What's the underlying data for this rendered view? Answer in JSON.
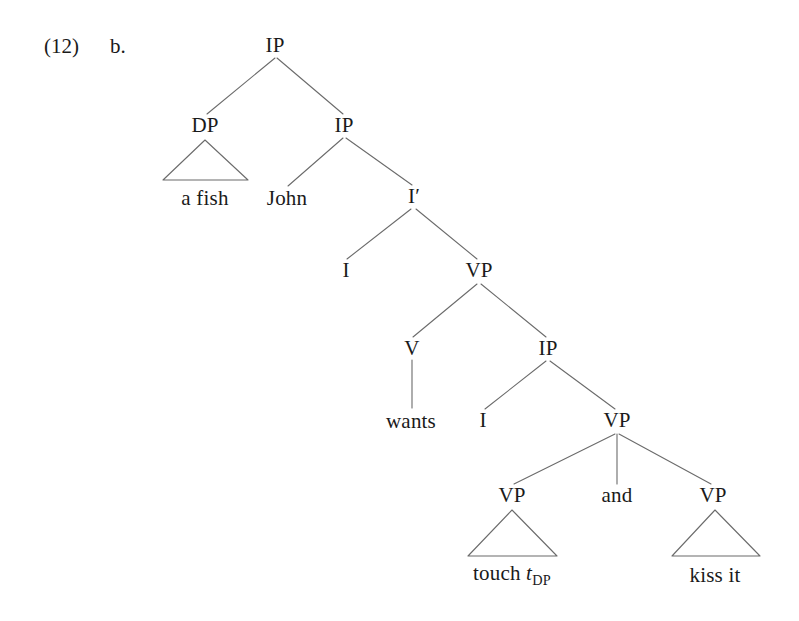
{
  "figure": {
    "example_number": "(12)",
    "sub_label": "b.",
    "caption_full": "(12) b."
  },
  "colors": {
    "background": "#ffffff",
    "text": "#1a1a1a",
    "edge": "#6b6b6b"
  },
  "tree": {
    "type": "syntax-tree",
    "sentence": "a fish John wants touch t-DP and kiss it",
    "nodes": {
      "root_ip": {
        "label": "IP",
        "x": 275,
        "y": 45
      },
      "dp": {
        "label": "DP",
        "x": 205,
        "y": 125
      },
      "ip2": {
        "label": "IP",
        "x": 344,
        "y": 125
      },
      "i_bar": {
        "label": "I′",
        "x": 414,
        "y": 196
      },
      "i1": {
        "label": "I",
        "x": 346,
        "y": 270
      },
      "vp1": {
        "label": "VP",
        "x": 479,
        "y": 270
      },
      "v": {
        "label": "V",
        "x": 412,
        "y": 348
      },
      "ip3": {
        "label": "IP",
        "x": 548,
        "y": 348
      },
      "i2": {
        "label": "I",
        "x": 483,
        "y": 420
      },
      "vp2": {
        "label": "VP",
        "x": 617,
        "y": 420
      },
      "vp_left": {
        "label": "VP",
        "x": 512,
        "y": 495
      },
      "conj": {
        "label": "and",
        "x": 617,
        "y": 495
      },
      "vp_right": {
        "label": "VP",
        "x": 713,
        "y": 495
      }
    },
    "terminals": {
      "a_fish": {
        "label": "a fish",
        "x": 205,
        "y": 198
      },
      "john": {
        "label": "John",
        "x": 287,
        "y": 198
      },
      "wants": {
        "label": "wants",
        "x": 411,
        "y": 421
      },
      "touch_trace": {
        "label_prefix": "touch ",
        "trace_symbol": "t",
        "trace_subscript": "DP",
        "x": 512,
        "y": 575
      },
      "kiss_it": {
        "label": "kiss it",
        "x": 715,
        "y": 575
      }
    },
    "triangles": [
      {
        "name": "dp-triangle",
        "apex_x": 205,
        "apex_y": 140,
        "left_x": 163,
        "right_x": 248,
        "base_y": 180
      },
      {
        "name": "vp-left-triangle",
        "apex_x": 512,
        "apex_y": 510,
        "left_x": 468,
        "right_x": 557,
        "base_y": 556
      },
      {
        "name": "vp-right-triangle",
        "apex_x": 715,
        "apex_y": 510,
        "left_x": 672,
        "right_x": 760,
        "base_y": 556
      }
    ],
    "edges": [
      {
        "name": "root-ip-to-dp",
        "x1": 275,
        "y1": 58,
        "x2": 207,
        "y2": 114
      },
      {
        "name": "root-ip-to-ip2",
        "x1": 277,
        "y1": 58,
        "x2": 343,
        "y2": 114
      },
      {
        "name": "ip2-to-john",
        "x1": 343,
        "y1": 138,
        "x2": 288,
        "y2": 186
      },
      {
        "name": "ip2-to-i-bar",
        "x1": 346,
        "y1": 138,
        "x2": 412,
        "y2": 185
      },
      {
        "name": "i-bar-to-i1",
        "x1": 411,
        "y1": 209,
        "x2": 347,
        "y2": 259
      },
      {
        "name": "i-bar-to-vp1",
        "x1": 416,
        "y1": 209,
        "x2": 477,
        "y2": 259
      },
      {
        "name": "vp1-to-v",
        "x1": 477,
        "y1": 284,
        "x2": 413,
        "y2": 337
      },
      {
        "name": "vp1-to-ip3",
        "x1": 481,
        "y1": 284,
        "x2": 546,
        "y2": 337
      },
      {
        "name": "v-to-wants",
        "x1": 412,
        "y1": 360,
        "x2": 412,
        "y2": 408
      },
      {
        "name": "ip3-to-i2",
        "x1": 546,
        "y1": 361,
        "x2": 485,
        "y2": 409
      },
      {
        "name": "ip3-to-vp2",
        "x1": 550,
        "y1": 361,
        "x2": 615,
        "y2": 409
      },
      {
        "name": "vp2-to-vp-left",
        "x1": 615,
        "y1": 434,
        "x2": 514,
        "y2": 484
      },
      {
        "name": "vp2-to-and",
        "x1": 617,
        "y1": 434,
        "x2": 617,
        "y2": 484
      },
      {
        "name": "vp2-to-vp-right",
        "x1": 619,
        "y1": 434,
        "x2": 711,
        "y2": 484
      }
    ]
  }
}
